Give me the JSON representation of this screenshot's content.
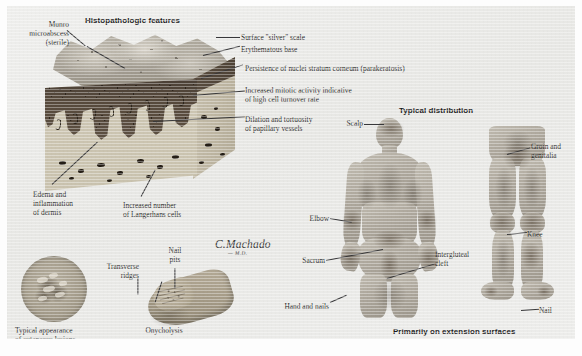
{
  "plate": {
    "subject": "Psoriasis",
    "background_color": "#e9e9e7",
    "ink_color": "#2c2c2c"
  },
  "headings": {
    "histopathologic_features": "Histopathologic features",
    "typical_distribution": "Typical distribution",
    "extension_surfaces": "Primarily on extension surfaces"
  },
  "signature": {
    "name": "C.Machado",
    "credential": "— M.D."
  },
  "histology_labels": {
    "munro": "Munro\nmicroabscess\n(sterile)",
    "silver_scale": "Surface \"silver\" scale",
    "erythematous_base": "Erythematous base",
    "parakeratosis": "Persistence of nuclei stratum corneum (parakeratosis)",
    "mitotic_activity": "Increased mitotic activity indicative\nof high cell turnover rate",
    "papillary_vessels": "Dilation and tortuosity\nof papillary vessels",
    "edema": "Edema and\ninflammation\nof dermis",
    "langerhans": "Increased number\nof Langerhans cells"
  },
  "inset_labels": {
    "plaque": "Typical appearance\nof cutaneous lesions\n(plaque lesion)",
    "transverse_ridges": "Transverse\nridges",
    "nail_pits": "Nail\npits",
    "onycholysis": "Onycholysis"
  },
  "distribution_labels": {
    "scalp": "Scalp",
    "elbow": "Elbow",
    "sacrum": "Sacrum",
    "hand_and_nails": "Hand and nails",
    "intergluteal_cleft": "Intergluteal\ncleft",
    "groin_and_genitalia": "Groin and\ngenitalia",
    "knee": "Knee",
    "nail": "Nail"
  }
}
